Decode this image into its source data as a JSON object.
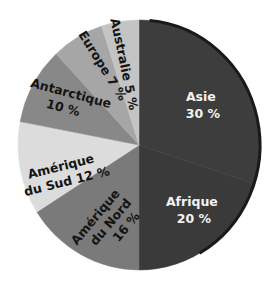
{
  "chart_data": {
    "type": "pie",
    "title": "",
    "unit": "%",
    "start_angle_deg": 0,
    "direction": "clockwise",
    "slices": [
      {
        "name": "Asie",
        "label": "Asie",
        "value_label": "30 %",
        "value": 30,
        "color": "#3d3d3d"
      },
      {
        "name": "Afrique",
        "label": "Afrique",
        "value_label": "20 %",
        "value": 20,
        "color": "#3a3a3a"
      },
      {
        "name": "Amérique du Nord",
        "label": "Amérique du Nord",
        "value_label": "16 %",
        "value": 16,
        "color": "#7a7a7a"
      },
      {
        "name": "Amérique du Sud",
        "label": "Amérique du Sud",
        "value_label": "12 %",
        "value": 12,
        "color": "#dcdcdc"
      },
      {
        "name": "Antarctique",
        "label": "Antarctique",
        "value_label": "10 %",
        "value": 10,
        "color": "#888888"
      },
      {
        "name": "Europe",
        "label": "Europe",
        "value_label": "7 %",
        "value": 7,
        "color": "#a6a6a6"
      },
      {
        "name": "Australie",
        "label": "Australie",
        "value_label": "5 %",
        "value": 5,
        "color": "#c4c4c4"
      }
    ]
  },
  "labels": {
    "asie_line1": "Asie",
    "asie_line2": "30 %",
    "afrique_line1": "Afrique",
    "afrique_line2": "20 %",
    "amnord_line1": "Amérique",
    "amnord_line2": "du Nord",
    "amnord_line3": "16 %",
    "amsud_line1": "Amérique",
    "amsud_line2": "du Sud 12 %",
    "antarctique_line1": "Antarctique",
    "antarctique_line2": "10 %",
    "europe": "Europe 7 %",
    "australie": "Australie 5 %"
  }
}
